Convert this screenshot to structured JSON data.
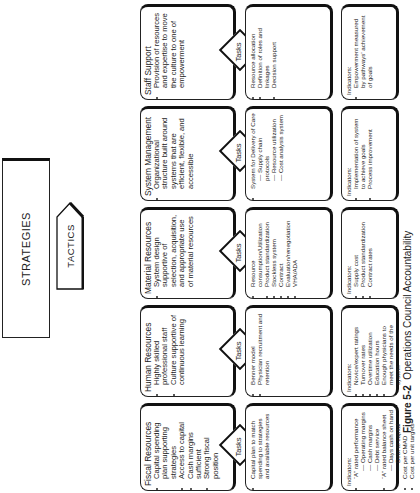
{
  "header": {
    "strategies": "STRATEGIES",
    "tactics": "TACTICS"
  },
  "tasks_label": "Tasks",
  "columns": [
    {
      "title": "Fiscal Resources",
      "strategy": [
        "Capital spending plan supporting strategies",
        "Access to capital",
        "Cash margins sufficient",
        "Strong fiscal position"
      ],
      "tasks": [
        "Capital plan to match spending to strategies and available resources"
      ],
      "indicators_label": "Indicators:",
      "indicators": [
        "“A” rated performance",
        "— Operating margins",
        "— Cash margins",
        "— Debt service",
        "“A” rated balance sheet",
        "— Days cash on hand",
        "— Debt to capital",
        "Cost per CMAD",
        "Cost per unit targets"
      ]
    },
    {
      "title": "Human Resources",
      "strategy": [
        "Highly skilled professional staff",
        "Culture supportive of continuous learning"
      ],
      "tasks": [
        "Benner model",
        "Physician recruitment and retention"
      ],
      "indicators_label": "Indicators:",
      "indicators": [
        "Novice/expert ratings",
        "Turnover rates",
        "Overtime utilization",
        "Education hours",
        "Enough physicians to meet the needs of the system"
      ]
    },
    {
      "title": "Material Resources",
      "strategy": [
        "System design supportive of selection, acquisition, and appropriate use of material resources"
      ],
      "tasks": [
        "Resource consumption/Utilization",
        "Product standardization",
        "Stockless system",
        "Contract",
        "Evaluation/renegotiation",
        "VHA/ADA"
      ],
      "indicators_label": "Indicators:",
      "indicators": [
        "Supply cost",
        "Product standardization",
        "Contract rates"
      ]
    },
    {
      "title": "System Management",
      "strategy": [
        "Organizational structure built around systems that are efficient, flexible, and accessible"
      ],
      "tasks": [
        "System for Delivery of Care",
        "— Supply chain protocols",
        "— Resource utilization",
        "— Cost analysis system"
      ],
      "indicators_label": "Indicators:",
      "indicators": [
        "Implementation of system to achieve goals",
        "Process improvement"
      ]
    },
    {
      "title": "Staff Support",
      "strategy": [
        "Provision of resources and expertise to move the culture to one of empowerment"
      ],
      "tasks": [
        "Resource allocation",
        "Definition of roles and linkages",
        "Decision support"
      ],
      "indicators_label": "Indicators:",
      "indicators": [
        "Empowerment measured by pathways' achievement of goals"
      ]
    }
  ],
  "caption": {
    "figure": "Figure 5-2",
    "text": "Operations Council Accountability"
  }
}
